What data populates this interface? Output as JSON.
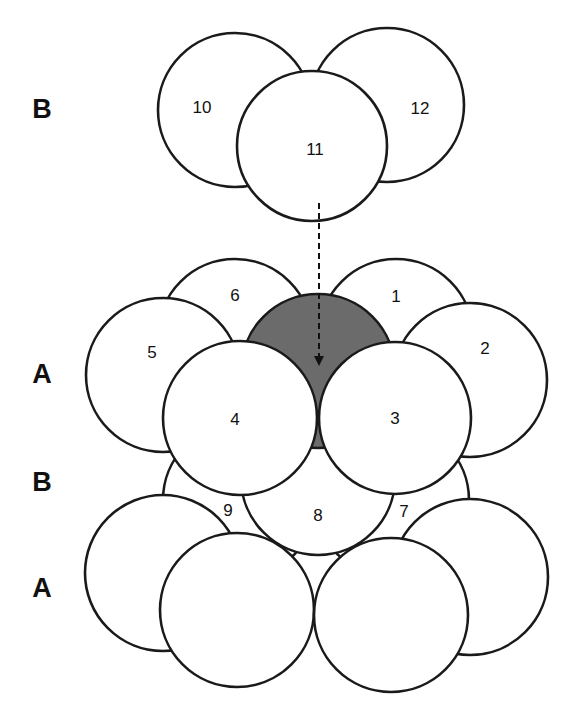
{
  "layer_labels": [
    {
      "text": "B",
      "x": 42,
      "y": 109
    },
    {
      "text": "A",
      "x": 42,
      "y": 374
    },
    {
      "text": "B",
      "x": 42,
      "y": 482
    },
    {
      "text": "A",
      "x": 42,
      "y": 588
    }
  ],
  "sphere_labels": {
    "s1": "1",
    "s2": "2",
    "s3": "3",
    "s4": "4",
    "s5": "5",
    "s6": "6",
    "s7": "7",
    "s8": "8",
    "s9": "9",
    "s10": "10",
    "s11": "11",
    "s12": "12"
  },
  "colors": {
    "sphere_fill": "#ffffff",
    "outline": "#1a1a1a",
    "shaded_sphere": "#6b6b6b"
  },
  "arrow": {
    "style": "dashed",
    "direction": "down",
    "from": "sphere 11",
    "to": "shaded sphere"
  }
}
